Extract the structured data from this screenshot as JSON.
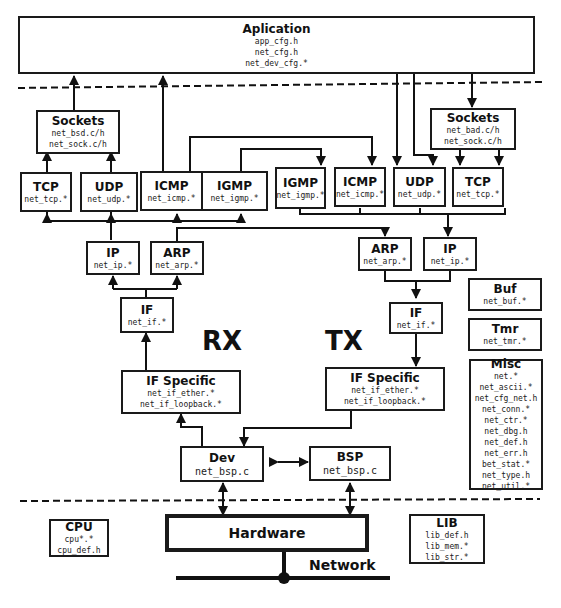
{
  "diagram": {
    "application": {
      "title": "Aplication",
      "files": [
        "app_cfg.h",
        "net_cfg.h",
        "net_dev_cfg.*"
      ]
    },
    "rx": {
      "label": "RX",
      "sockets": {
        "title": "Sockets",
        "files": [
          "net_bsd.c/h",
          "net_sock.c/h"
        ]
      },
      "tcp": {
        "title": "TCP",
        "files": [
          "net_tcp.*"
        ]
      },
      "udp": {
        "title": "UDP",
        "files": [
          "net_udp.*"
        ]
      },
      "icmp": {
        "title": "ICMP",
        "files": [
          "net_icmp.*"
        ]
      },
      "igmp": {
        "title": "IGMP",
        "files": [
          "net_igmp.*"
        ]
      },
      "ip": {
        "title": "IP",
        "files": [
          "net_ip.*"
        ]
      },
      "arp": {
        "title": "ARP",
        "files": [
          "net_arp.*"
        ]
      },
      "if": {
        "title": "IF",
        "files": [
          "net_if.*"
        ]
      },
      "if_specific": {
        "title": "IF Specific",
        "files": [
          "net_if_ether.*",
          "net_if_loopback.*"
        ]
      }
    },
    "tx": {
      "label": "TX",
      "sockets": {
        "title": "Sockets",
        "files": [
          "net_bad.c/h",
          "net_sock.c/h"
        ]
      },
      "igmp": {
        "title": "IGMP",
        "files": [
          "net_igmp.*"
        ]
      },
      "icmp": {
        "title": "ICMP",
        "files": [
          "net_icmp.*"
        ]
      },
      "udp": {
        "title": "UDP",
        "files": [
          "net_udp.*"
        ]
      },
      "tcp": {
        "title": "TCP",
        "files": [
          "net_tcp.*"
        ]
      },
      "arp": {
        "title": "ARP",
        "files": [
          "net_arp.*"
        ]
      },
      "ip": {
        "title": "IP",
        "files": [
          "net_ip.*"
        ]
      },
      "if": {
        "title": "IF",
        "files": [
          "net_if.*"
        ]
      },
      "if_specific": {
        "title": "IF Specific",
        "files": [
          "net_if_ether.*",
          "net_if_loopback.*"
        ]
      }
    },
    "buf": {
      "title": "Buf",
      "files": [
        "net_buf.*"
      ]
    },
    "tmr": {
      "title": "Tmr",
      "files": [
        "net_tmr.*"
      ]
    },
    "misc": {
      "title": "Misc",
      "files": [
        "net.*",
        "net_ascii.*",
        "net_cfg_net.h",
        "net_conn.*",
        "net_ctr.*",
        "net_dbg.h",
        "net_def.h",
        "net_err.h",
        "bet_stat.*",
        "net_type.h",
        "net_util.*"
      ]
    },
    "dev": {
      "title": "Dev",
      "files": [
        "net_bsp.c"
      ]
    },
    "bsp": {
      "title": "BSP",
      "files": [
        "net_bsp.c"
      ]
    },
    "cpu": {
      "title": "CPU",
      "files": [
        "cpu*.*",
        "cpu_def.h"
      ]
    },
    "hardware": {
      "title": "Hardware"
    },
    "lib": {
      "title": "LIB",
      "files": [
        "lib_def.h",
        "lib_mem.*",
        "lib_str.*"
      ]
    },
    "network": {
      "label": "Network"
    }
  }
}
